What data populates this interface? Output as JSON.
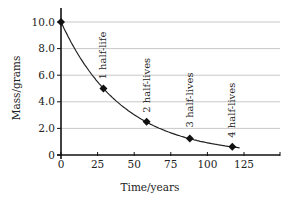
{
  "chart_data": {
    "type": "line",
    "title": "",
    "xlabel": "Time/years",
    "ylabel": "Mass/grams",
    "xlim": [
      0,
      150
    ],
    "ylim": [
      0,
      10.5
    ],
    "x_ticks": [
      0,
      25,
      50,
      75,
      100,
      125
    ],
    "x_tick_labels": [
      "0",
      "25",
      "50",
      "75",
      "100",
      "125"
    ],
    "y_ticks": [
      0,
      2,
      4,
      6,
      8,
      10
    ],
    "y_tick_labels": [
      "0",
      "2.0",
      "4.0",
      "6.0",
      "8.0",
      "10.0"
    ],
    "grid": "horizontal",
    "legend": "none",
    "series": [
      {
        "name": "Mass remaining",
        "x": [
          0,
          29,
          58.5,
          88,
          117
        ],
        "y": [
          10.0,
          5.0,
          2.5,
          1.25,
          0.625
        ],
        "marker": "diamond",
        "curve": "smooth exponential decay, extends to ~122 years"
      }
    ],
    "annotations": [
      {
        "text": "1 half-life",
        "x": 29,
        "y": 5.0
      },
      {
        "text": "2 half-lives",
        "x": 58.5,
        "y": 2.5
      },
      {
        "text": "3 half-lives",
        "x": 88,
        "y": 1.25
      },
      {
        "text": "4 half-lives",
        "x": 117,
        "y": 0.625
      }
    ]
  },
  "colors": {
    "line": "#222222",
    "grid": "#c8c8c8",
    "axis": "#111111"
  }
}
